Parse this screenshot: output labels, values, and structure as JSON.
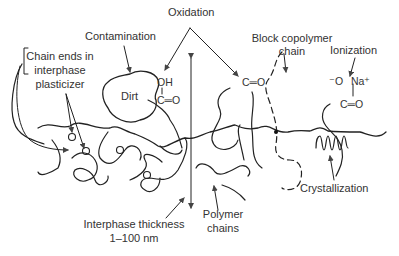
{
  "diagram": {
    "labels": {
      "oxidation": "Oxidation",
      "contamination": "Contamination",
      "block_copolymer_line1": "Block copolymer",
      "block_copolymer_line2": "chain",
      "ionization": "Ionization",
      "chain_ends_line1": "Chain ends in",
      "chain_ends_line2": "interphase",
      "chain_ends_line3": "plasticizer",
      "dirt": "Dirt",
      "interphase_line1": "Interphase thickness",
      "interphase_line2": "1–100 nm",
      "polymer_chains_line1": "Polymer",
      "polymer_chains_line2": "chains",
      "crystallization": "Crystallization"
    },
    "chemistry": {
      "oh": "OH",
      "carbonyl_left": "C═O",
      "carbonyl_mid": "C═O",
      "ion_o": "⁻O",
      "ion_na": "Na⁺",
      "carbonyl_right": "C═O"
    },
    "colors": {
      "line": "#222222",
      "text": "#333333",
      "arrow": "#555555"
    }
  }
}
